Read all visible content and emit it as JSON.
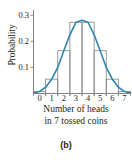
{
  "figure": {
    "panel_label": "(b)",
    "x_axis_caption_line1": "Number of heads",
    "x_axis_caption_line2": "in 7 tossed coins"
  },
  "chart_data": {
    "type": "bar",
    "title": "",
    "subtitle": "",
    "xlabel": "Number of heads in 7 tossed coins",
    "ylabel": "Probability",
    "categories": [
      "0",
      "1",
      "2",
      "3",
      "4",
      "5",
      "6",
      "7"
    ],
    "values": [
      0.008,
      0.055,
      0.164,
      0.273,
      0.273,
      0.164,
      0.055,
      0.008
    ],
    "x": [
      0,
      1,
      2,
      3,
      4,
      5,
      6,
      7
    ],
    "xlim": [
      -0.5,
      7.5
    ],
    "ylim": [
      0,
      0.32
    ],
    "y_tick_labels": [
      "0.1",
      "0.2",
      "0.3"
    ],
    "y_tick_values": [
      0.1,
      0.2,
      0.3
    ],
    "x_tick_labels": [
      "0",
      "1",
      "2",
      "3",
      "4",
      "5",
      "6",
      "7"
    ],
    "grid": false,
    "legend": "none",
    "bar_edge_color": "#808285",
    "bar_fill_color": "none",
    "overlay": {
      "name": "normal approximation curve",
      "type": "line",
      "color": "#2e86b0",
      "x": [
        -0.5,
        0,
        0.5,
        1,
        1.5,
        2,
        2.5,
        3,
        3.5,
        4,
        4.5,
        5,
        5.5,
        6,
        6.5,
        7,
        7.5
      ],
      "values": [
        0.002,
        0.008,
        0.024,
        0.055,
        0.1,
        0.164,
        0.225,
        0.273,
        0.281,
        0.273,
        0.225,
        0.164,
        0.1,
        0.055,
        0.024,
        0.008,
        0.002
      ]
    }
  }
}
